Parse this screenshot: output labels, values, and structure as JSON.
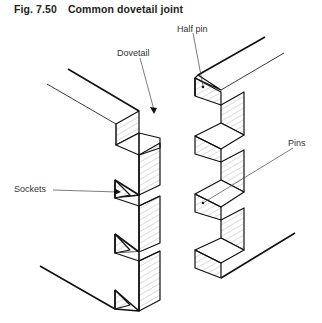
{
  "figure": {
    "number": "Fig. 7.50",
    "title": "Common dovetail joint"
  },
  "labels": {
    "half_pin": "Half pin",
    "dovetail": "Dovetail",
    "sockets": "Sockets",
    "pins": "Pins"
  },
  "parts": [
    {
      "name": "tail-board",
      "description": "Left board with dovetails and sockets"
    },
    {
      "name": "pin-board",
      "description": "Right board with half pins and pins"
    }
  ]
}
